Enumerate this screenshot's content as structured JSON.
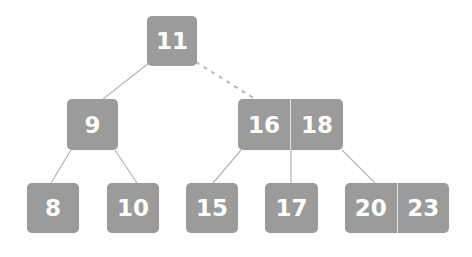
{
  "diagram": {
    "type": "b-tree",
    "colors": {
      "node_fill": "#9b9b9b",
      "key_text": "#ffffff",
      "edge": "#b8b8b8",
      "divider": "#e8e8e8"
    },
    "nodes": [
      {
        "id": "root",
        "keys": [
          "11"
        ],
        "x": 147,
        "y": 16,
        "w": 50,
        "h": 50,
        "level": 0
      },
      {
        "id": "n9",
        "keys": [
          "9"
        ],
        "x": 67,
        "y": 99,
        "w": 51,
        "h": 51,
        "level": 1
      },
      {
        "id": "n16_18",
        "keys": [
          "16",
          "18"
        ],
        "x": 238,
        "y": 99,
        "w": 105,
        "h": 51,
        "level": 1
      },
      {
        "id": "n8",
        "keys": [
          "8"
        ],
        "x": 27,
        "y": 183,
        "w": 52,
        "h": 50,
        "level": 2
      },
      {
        "id": "n10",
        "keys": [
          "10"
        ],
        "x": 107,
        "y": 183,
        "w": 52,
        "h": 50,
        "level": 2
      },
      {
        "id": "n15",
        "keys": [
          "15"
        ],
        "x": 186,
        "y": 183,
        "w": 52,
        "h": 50,
        "level": 2
      },
      {
        "id": "n17",
        "keys": [
          "17"
        ],
        "x": 265,
        "y": 183,
        "w": 53,
        "h": 50,
        "level": 2
      },
      {
        "id": "n20_23",
        "keys": [
          "20",
          "23"
        ],
        "x": 345,
        "y": 183,
        "w": 104,
        "h": 50,
        "level": 2
      }
    ],
    "edges": [
      {
        "from": "root",
        "to": "n9",
        "x1": 149,
        "y1": 63,
        "x2": 103,
        "y2": 99,
        "style": "solid"
      },
      {
        "from": "root",
        "to": "n16_18",
        "x1": 196,
        "y1": 62,
        "x2": 255,
        "y2": 99,
        "style": "dashed"
      },
      {
        "from": "n9",
        "to": "n8",
        "x1": 71,
        "y1": 150,
        "x2": 51,
        "y2": 183,
        "style": "solid"
      },
      {
        "from": "n9",
        "to": "n10",
        "x1": 115,
        "y1": 150,
        "x2": 137,
        "y2": 183,
        "style": "solid"
      },
      {
        "from": "n16_18",
        "to": "n15",
        "x1": 241,
        "y1": 150,
        "x2": 213,
        "y2": 183,
        "style": "solid"
      },
      {
        "from": "n16_18",
        "to": "n17",
        "x1": 291,
        "y1": 150,
        "x2": 291,
        "y2": 183,
        "style": "solid"
      },
      {
        "from": "n16_18",
        "to": "n20_23",
        "x1": 342,
        "y1": 150,
        "x2": 375,
        "y2": 183,
        "style": "solid"
      }
    ]
  }
}
